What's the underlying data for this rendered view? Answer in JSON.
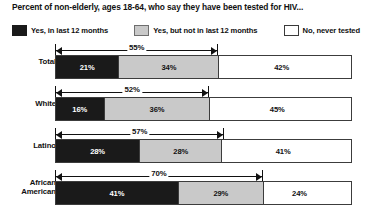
{
  "title": "Percent of non-elderly, ages 18-64, who say they have been tested for HIV...",
  "legend": [
    {
      "key": "recent",
      "label": "Yes, in last 12 months",
      "swatch": "black-swatch-icon",
      "color": "#1a1a1a"
    },
    {
      "key": "past",
      "label": "Yes, but not in last 12 months",
      "swatch": "gray-swatch-icon",
      "color": "#c9c9c9"
    },
    {
      "key": "never",
      "label": "No, never tested",
      "swatch": "white-swatch-icon",
      "color": "#ffffff"
    }
  ],
  "rows": [
    {
      "label_line1": "Total",
      "label_line2": "",
      "recent": "21%",
      "past": "34%",
      "never": "42%",
      "total_tested": "55%"
    },
    {
      "label_line1": "White",
      "label_line2": "",
      "recent": "16%",
      "past": "36%",
      "never": "45%",
      "total_tested": "52%"
    },
    {
      "label_line1": "Latino",
      "label_line2": "",
      "recent": "28%",
      "past": "28%",
      "never": "41%",
      "total_tested": "57%"
    },
    {
      "label_line1": "African",
      "label_line2": "American",
      "recent": "41%",
      "past": "29%",
      "never": "24%",
      "total_tested": "70%"
    }
  ],
  "chart_data": {
    "type": "bar",
    "subtype": "stacked-horizontal",
    "title": "Percent of non-elderly, ages 18-64, who say they have been tested for HIV...",
    "xlabel": "",
    "ylabel": "",
    "xlim": [
      0,
      100
    ],
    "grid": false,
    "legend_position": "top",
    "categories": [
      "Total",
      "White",
      "Latino",
      "African American"
    ],
    "series": [
      {
        "name": "Yes, in last 12 months",
        "values": [
          21,
          16,
          28,
          41
        ],
        "color": "#1a1a1a"
      },
      {
        "name": "Yes, but not in last 12 months",
        "values": [
          34,
          36,
          28,
          29
        ],
        "color": "#c9c9c9"
      },
      {
        "name": "No, never tested",
        "values": [
          42,
          45,
          41,
          24
        ],
        "color": "#ffffff"
      }
    ],
    "annotations": [
      {
        "category": "Total",
        "label": "55%",
        "spans": [
          "Yes, in last 12 months",
          "Yes, but not in last 12 months"
        ],
        "value": 55
      },
      {
        "category": "White",
        "label": "52%",
        "spans": [
          "Yes, in last 12 months",
          "Yes, but not in last 12 months"
        ],
        "value": 52
      },
      {
        "category": "Latino",
        "label": "57%",
        "spans": [
          "Yes, in last 12 months",
          "Yes, but not in last 12 months"
        ],
        "value": 57
      },
      {
        "category": "African American",
        "label": "70%",
        "spans": [
          "Yes, in last 12 months",
          "Yes, but not in last 12 months"
        ],
        "value": 70
      }
    ]
  }
}
